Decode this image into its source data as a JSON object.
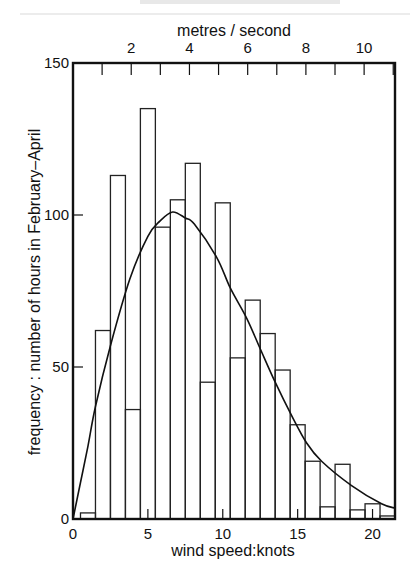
{
  "chart_data": {
    "type": "bar",
    "subtype": "histogram-with-fitted-curve",
    "title": "",
    "xlabel": "wind speed: knots",
    "x2label": "metres / second",
    "ylabel": "frequency : number of hours in February–April",
    "xlim": [
      0,
      21.5
    ],
    "ylim": [
      0,
      150
    ],
    "x_ticks": [
      0,
      5,
      10,
      15,
      20
    ],
    "x_minor_ticks": [
      1,
      2,
      3,
      4,
      6,
      7,
      8,
      9,
      11,
      12,
      13,
      14,
      16,
      17,
      18,
      19,
      21
    ],
    "x2_ticks": [
      1,
      2,
      3,
      4,
      5,
      6,
      7,
      8,
      9,
      10,
      11
    ],
    "x2_tick_labels": [
      2,
      4,
      6,
      8,
      10
    ],
    "y_ticks": [
      0,
      50,
      100,
      150
    ],
    "grid": false,
    "bin_width": 1,
    "categories": [
      1,
      2,
      3,
      4,
      5,
      6,
      7,
      8,
      9,
      10,
      11,
      12,
      13,
      14,
      15,
      16,
      17,
      18,
      19,
      20,
      21
    ],
    "series": [
      {
        "name": "observed frequency",
        "type": "bar",
        "values": [
          2,
          62,
          113,
          36,
          135,
          96,
          105,
          117,
          45,
          104,
          53,
          72,
          61,
          49,
          31,
          19,
          4,
          18,
          3,
          5,
          1
        ]
      },
      {
        "name": "fitted distribution",
        "type": "line",
        "x": [
          0,
          0.5,
          1,
          1.5,
          2.5,
          3.8,
          5.0,
          5.8,
          6.65,
          7.5,
          8.1,
          9.6,
          10.5,
          11.6,
          12.5,
          13.5,
          14.6,
          15.6,
          16.6,
          18.6,
          20.6,
          21.5
        ],
        "values": [
          0,
          12,
          24,
          37,
          57,
          79,
          93,
          98,
          101,
          99,
          97,
          86,
          76,
          66,
          56,
          45,
          34,
          25,
          19,
          11,
          5,
          3.6
        ]
      }
    ]
  },
  "labels": {
    "x_axis_title": "wind speed:knots",
    "x2_axis_title": "metres / second",
    "y_axis_title": "frequency : number of hours in February–April"
  }
}
